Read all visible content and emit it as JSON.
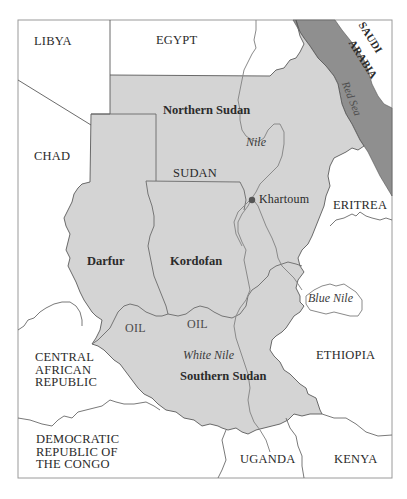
{
  "map": {
    "colors": {
      "sudan_fill": "#d4d4d4",
      "sea_fill": "#8f8f8f",
      "background": "#ffffff",
      "border": "#5a5a5a",
      "river": "#8a8a8a",
      "city_dot": "#555555"
    },
    "countries": {
      "libya": "LIBYA",
      "egypt": "EGYPT",
      "saudi_arabia_line1": "SAUDI",
      "saudi_arabia_line2": "ARABIA",
      "chad": "CHAD",
      "eritrea": "ERITREA",
      "ethiopia": "ETHIOPIA",
      "car_line1": "CENTRAL",
      "car_line2": "AFRICAN",
      "car_line3": "REPUBLIC",
      "drc_line1": "DEMOCRATIC",
      "drc_line2": "REPUBLIC OF",
      "drc_line3": "THE CONGO",
      "uganda": "UGANDA",
      "kenya": "KENYA",
      "sudan": "SUDAN"
    },
    "regions": {
      "northern_sudan": "Northern Sudan",
      "darfur": "Darfur",
      "kordofan": "Kordofan",
      "southern_sudan": "Southern Sudan"
    },
    "water": {
      "red_sea": "Red Sea",
      "nile": "Nile",
      "blue_nile": "Blue Nile",
      "white_nile": "White Nile"
    },
    "cities": {
      "khartoum": "Khartoum"
    },
    "resources": {
      "oil_west": "OIL",
      "oil_east": "OIL"
    }
  }
}
